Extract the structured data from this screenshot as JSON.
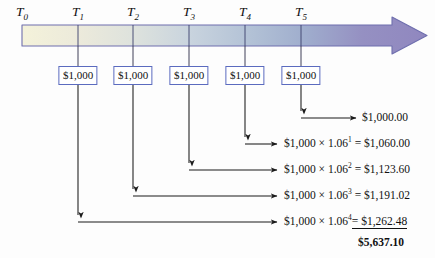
{
  "figure": {
    "type": "timeline-cash-flow-diagram",
    "background_color": "#fdfdfd",
    "arrow": {
      "name": "time-arrow",
      "direction": "left-to-right",
      "gradient_stops": [
        "#f2f0d8",
        "#dfe3dc",
        "#c3cfdb",
        "#aebfd2",
        "#9aa8c8",
        "#8f87bd",
        "#8f7fbb"
      ],
      "outline_color": "#6f6fae",
      "head_color": "#9189c4"
    },
    "tick_color": "#3b3f6b",
    "flow_line_color": "#1a1a1a"
  },
  "time_labels": [
    {
      "base": "T",
      "sub": "0"
    },
    {
      "base": "T",
      "sub": "1"
    },
    {
      "base": "T",
      "sub": "2"
    },
    {
      "base": "T",
      "sub": "3"
    },
    {
      "base": "T",
      "sub": "4"
    },
    {
      "base": "T",
      "sub": "5"
    }
  ],
  "cash_flows": [
    {
      "label": "$1,000",
      "at": "T1"
    },
    {
      "label": "$1,000",
      "at": "T2"
    },
    {
      "label": "$1,000",
      "at": "T3"
    },
    {
      "label": "$1,000",
      "at": "T4"
    },
    {
      "label": "$1,000",
      "at": "T5"
    }
  ],
  "results": [
    {
      "expression": "",
      "value": "$1,000.00",
      "has_expression": false
    },
    {
      "principal": "$1,000",
      "times": "×",
      "rate": "1.06",
      "exponent": "1",
      "equals": "=",
      "value": "$1,060.00",
      "has_expression": true
    },
    {
      "principal": "$1,000",
      "times": "×",
      "rate": "1.06",
      "exponent": "2",
      "equals": "=",
      "value": "$1,123.60",
      "has_expression": true
    },
    {
      "principal": "$1,000",
      "times": "×",
      "rate": "1.06",
      "exponent": "3",
      "equals": "=",
      "value": "$1,191.02",
      "has_expression": true
    },
    {
      "principal": "$1,000",
      "times": "×",
      "rate": "1.06",
      "exponent": "4",
      "equals": "=",
      "value": "$1,262.48",
      "has_expression": true,
      "underlined": true
    }
  ],
  "total": {
    "label": "$5,637.10",
    "bold": true
  }
}
